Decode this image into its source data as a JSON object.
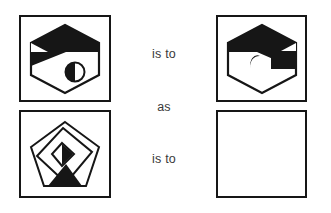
{
  "puzzle": {
    "type": "visual-analogy",
    "format": "A is to B as C is to D",
    "background_color": "#ffffff",
    "ink_color": "#161616",
    "text_color": "#3a3a3a",
    "relations": [
      {
        "id": "rel-1",
        "label": "is to"
      },
      {
        "id": "rel-2",
        "label": "as"
      },
      {
        "id": "rel-3",
        "label": "is to"
      }
    ],
    "panels": [
      {
        "id": "panel-a",
        "role": "analogy-term-a",
        "position": "top-left",
        "empty": false,
        "shape": "hexagon",
        "description": "Hexagon with black upper band, white triangular wedge on left, black left strip, and a half-filled circle in the lower right",
        "fill": "black-and-white",
        "contains_circle": true
      },
      {
        "id": "panel-c",
        "role": "analogy-term-b",
        "position": "top-right",
        "empty": false,
        "shape": "hexagon",
        "description": "Mirrored hexagon with black upper band, white triangular wedge on right, and a small white crescent/oval in the upper left black region",
        "fill": "black-and-white",
        "contains_circle": true
      },
      {
        "id": "panel-b",
        "role": "analogy-term-c",
        "position": "bottom-left",
        "empty": false,
        "shape": "pentagon",
        "description": "Pentagon outline with an overlapping tilted square outline, a small black diamond at the center, and a black triangular region at the bottom",
        "fill": "outline-with-black-accents",
        "contains_circle": false
      },
      {
        "id": "panel-d",
        "role": "analogy-answer-blank",
        "position": "bottom-right",
        "empty": true,
        "shape": "none",
        "description": "Empty answer box",
        "fill": "white",
        "contains_circle": false
      }
    ]
  }
}
